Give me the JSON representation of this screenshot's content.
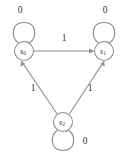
{
  "diagram": {
    "type": "finite-state-machine",
    "colors": {
      "background": "#ffffff",
      "stroke": "#8d8d8d",
      "node_fill": "#ffffff",
      "label": "#2e2e2e"
    },
    "states": [
      {
        "id": "s0",
        "base": "s",
        "subscript": "0",
        "label": "s0",
        "cx": 24,
        "cy": 51,
        "r": 9.5
      },
      {
        "id": "s1",
        "base": "s",
        "subscript": "1",
        "label": "s1",
        "cx": 104,
        "cy": 51,
        "r": 9.5
      },
      {
        "id": "s2",
        "base": "s",
        "subscript": "2",
        "label": "s2",
        "cx": 63,
        "cy": 122,
        "r": 9.5
      }
    ],
    "self_loops": [
      {
        "state": "s0",
        "label": "0",
        "position": "above",
        "label_x": 20,
        "label_y": 11
      },
      {
        "state": "s1",
        "label": "0",
        "position": "above",
        "label_x": 105,
        "label_y": 11
      },
      {
        "state": "s2",
        "label": "0",
        "position": "below",
        "label_x": 85,
        "label_y": 142
      }
    ],
    "transitions": [
      {
        "from": "s0",
        "to": "s1",
        "label": "1",
        "label_x": 64,
        "label_y": 39,
        "shape": "horizontal"
      },
      {
        "from": "s2",
        "to": "s0",
        "label": "1",
        "label_x": 33,
        "label_y": 89,
        "shape": "diagonal-left"
      },
      {
        "from": "s2",
        "to": "s1",
        "label": "1",
        "label_x": 90,
        "label_y": 89,
        "shape": "diagonal-right"
      }
    ]
  }
}
